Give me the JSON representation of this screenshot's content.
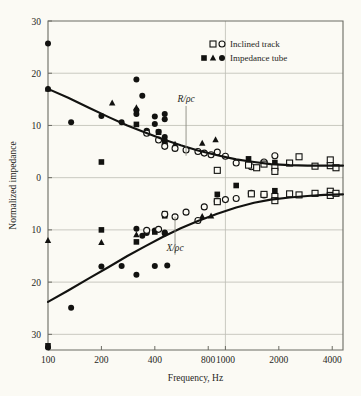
{
  "chart_data": {
    "type": "scatter",
    "title": "",
    "xlabel": "Frequency, Hz",
    "ylabel": "Normalized impedance",
    "xscale": "log",
    "xlim": [
      100,
      4600
    ],
    "ylim": [
      -33,
      30
    ],
    "grid": true,
    "xticks": [
      100,
      200,
      400,
      800,
      1000,
      2000,
      4000
    ],
    "xtick_labels": [
      "100",
      "200",
      "400",
      "800",
      "1000",
      "2000",
      "4000"
    ],
    "yticks": [
      30,
      20,
      10,
      0,
      -10,
      -20,
      -30
    ],
    "ytick_labels": [
      "30",
      "20",
      "10",
      "0",
      "10",
      "20",
      "30"
    ],
    "annotations": [
      {
        "text": "R/ρc",
        "x": 600,
        "y": 14.5,
        "leader_to_y": 4.2
      },
      {
        "text": "X/ρc",
        "x": 520,
        "y": -14.0,
        "leader_to_y": -7.5
      }
    ],
    "legend": {
      "position": "top-right",
      "entries": [
        {
          "label": "Inclined track",
          "markers": [
            "open-square",
            "open-circle"
          ]
        },
        {
          "label": "Impedance tube",
          "markers": [
            "filled-square",
            "filled-triangle",
            "filled-circle"
          ]
        }
      ]
    },
    "series": [
      {
        "name": "R/ρc fitted curve",
        "type": "line",
        "points": [
          [
            100,
            17.0
          ],
          [
            130,
            15.3
          ],
          [
            170,
            13.4
          ],
          [
            220,
            11.6
          ],
          [
            280,
            10.0
          ],
          [
            350,
            8.7
          ],
          [
            440,
            7.4
          ],
          [
            560,
            6.2
          ],
          [
            700,
            5.2
          ],
          [
            900,
            4.3
          ],
          [
            1150,
            3.5
          ],
          [
            1450,
            3.0
          ],
          [
            1800,
            2.6
          ],
          [
            2300,
            2.4
          ],
          [
            2900,
            2.3
          ],
          [
            3600,
            2.3
          ],
          [
            4600,
            2.3
          ]
        ]
      },
      {
        "name": "X/ρc fitted curve",
        "type": "line",
        "points": [
          [
            100,
            -23.8
          ],
          [
            130,
            -21.6
          ],
          [
            170,
            -19.3
          ],
          [
            220,
            -17.1
          ],
          [
            280,
            -15.0
          ],
          [
            350,
            -13.2
          ],
          [
            440,
            -11.4
          ],
          [
            560,
            -9.7
          ],
          [
            700,
            -8.3
          ],
          [
            900,
            -6.9
          ],
          [
            1150,
            -5.7
          ],
          [
            1450,
            -4.8
          ],
          [
            1800,
            -4.2
          ],
          [
            2300,
            -3.8
          ],
          [
            2900,
            -3.5
          ],
          [
            3600,
            -3.3
          ],
          [
            4600,
            -3.2
          ]
        ]
      },
      {
        "name": "Impedance tube R/ρc (filled circle)",
        "type": "scatter",
        "marker": "filled-circle",
        "points": [
          [
            100,
            25.7
          ],
          [
            100,
            17.0
          ],
          [
            135,
            10.6
          ],
          [
            200,
            11.8
          ],
          [
            260,
            10.6
          ],
          [
            315,
            18.8
          ],
          [
            315,
            12.9
          ],
          [
            315,
            12.2
          ],
          [
            340,
            15.7
          ],
          [
            360,
            9.0
          ],
          [
            400,
            11.7
          ],
          [
            400,
            10.3
          ],
          [
            420,
            8.8
          ],
          [
            455,
            12.2
          ],
          [
            455,
            11.2
          ],
          [
            455,
            6.5
          ],
          [
            455,
            7.8
          ]
        ]
      },
      {
        "name": "Impedance tube R/ρc (filled square)",
        "type": "scatter",
        "marker": "filled-square",
        "points": [
          [
            200,
            3.0
          ],
          [
            315,
            10.2
          ],
          [
            360,
            8.8
          ],
          [
            420,
            8.7
          ],
          [
            455,
            6.9
          ],
          [
            1350,
            3.6
          ],
          [
            1900,
            2.9
          ]
        ]
      },
      {
        "name": "Impedance tube R/ρc (filled triangle)",
        "type": "scatter",
        "marker": "filled-triangle",
        "points": [
          [
            100,
            17.0
          ],
          [
            230,
            14.3
          ],
          [
            315,
            13.4
          ],
          [
            520,
            6.4
          ],
          [
            740,
            6.6
          ],
          [
            880,
            7.3
          ]
        ]
      },
      {
        "name": "Inclined track R/ρc (open circle)",
        "type": "scatter",
        "marker": "open-circle",
        "points": [
          [
            360,
            8.5
          ],
          [
            420,
            7.2
          ],
          [
            455,
            6.0
          ],
          [
            520,
            5.6
          ],
          [
            600,
            5.3
          ],
          [
            700,
            5.0
          ],
          [
            760,
            4.7
          ],
          [
            830,
            4.4
          ],
          [
            900,
            4.9
          ],
          [
            1000,
            4.1
          ],
          [
            1150,
            2.8
          ],
          [
            1400,
            2.1
          ],
          [
            1650,
            3.0
          ],
          [
            1900,
            4.2
          ]
        ]
      },
      {
        "name": "Inclined track R/ρc (open square)",
        "type": "scatter",
        "marker": "open-square",
        "points": [
          [
            900,
            1.4
          ],
          [
            1350,
            2.4
          ],
          [
            1500,
            1.9
          ],
          [
            1650,
            2.6
          ],
          [
            1900,
            2.0
          ],
          [
            1900,
            1.2
          ],
          [
            2300,
            2.8
          ],
          [
            2600,
            4.0
          ],
          [
            3200,
            2.2
          ],
          [
            3900,
            3.4
          ],
          [
            3900,
            2.3
          ],
          [
            4200,
            1.9
          ]
        ]
      },
      {
        "name": "Impedance tube X/ρc (filled circle)",
        "type": "scatter",
        "marker": "filled-circle",
        "points": [
          [
            100,
            -32.5
          ],
          [
            135,
            -24.9
          ],
          [
            200,
            -17.0
          ],
          [
            260,
            -16.9
          ],
          [
            315,
            -9.8
          ],
          [
            315,
            -18.6
          ],
          [
            340,
            -11.1
          ],
          [
            360,
            -10.6
          ],
          [
            400,
            -16.9
          ],
          [
            400,
            -10.1
          ],
          [
            420,
            -9.9
          ],
          [
            455,
            -10.7
          ],
          [
            455,
            -10.5
          ],
          [
            470,
            -16.8
          ]
        ]
      },
      {
        "name": "Impedance tube X/ρc (filled square)",
        "type": "scatter",
        "marker": "filled-square",
        "points": [
          [
            100,
            -32.2
          ],
          [
            200,
            -10.0
          ],
          [
            315,
            -12.3
          ],
          [
            400,
            -10.4
          ],
          [
            455,
            -6.9
          ],
          [
            455,
            -7.3
          ],
          [
            900,
            -3.2
          ],
          [
            1150,
            -1.5
          ],
          [
            1400,
            -3.1
          ],
          [
            1900,
            -2.5
          ]
        ]
      },
      {
        "name": "Impedance tube X/ρc (filled triangle)",
        "type": "scatter",
        "marker": "filled-triangle",
        "points": [
          [
            100,
            -12.0
          ],
          [
            200,
            -12.4
          ],
          [
            315,
            -10.9
          ],
          [
            740,
            -7.4
          ],
          [
            830,
            -7.3
          ]
        ]
      },
      {
        "name": "Inclined track X/ρc (open circle)",
        "type": "scatter",
        "marker": "open-circle",
        "points": [
          [
            360,
            -10.1
          ],
          [
            420,
            -9.9
          ],
          [
            455,
            -7.0
          ],
          [
            520,
            -7.5
          ],
          [
            600,
            -6.6
          ],
          [
            700,
            -8.2
          ],
          [
            760,
            -5.6
          ],
          [
            900,
            -4.5
          ],
          [
            1000,
            -4.2
          ],
          [
            1150,
            -4.0
          ],
          [
            1400,
            -3.0
          ],
          [
            1650,
            -3.3
          ]
        ]
      },
      {
        "name": "Inclined track X/ρc (open square)",
        "type": "scatter",
        "marker": "open-square",
        "points": [
          [
            900,
            -4.6
          ],
          [
            1400,
            -3.1
          ],
          [
            1650,
            -3.2
          ],
          [
            1900,
            -3.6
          ],
          [
            1900,
            -4.4
          ],
          [
            2300,
            -3.1
          ],
          [
            2600,
            -3.3
          ],
          [
            3200,
            -3.0
          ],
          [
            3900,
            -2.6
          ],
          [
            3900,
            -3.4
          ],
          [
            4200,
            -3.0
          ]
        ]
      }
    ]
  },
  "colors": {
    "background": "#fbfaf4",
    "axis": "#6b6b63",
    "grid": "#bdbdb4",
    "ink": "#121210"
  }
}
